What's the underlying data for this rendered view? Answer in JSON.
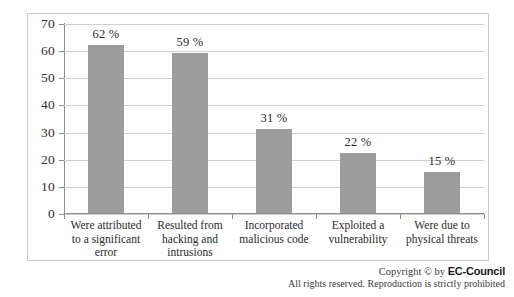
{
  "chart_data": {
    "type": "bar",
    "title": "",
    "subtitle": "",
    "xlabel": "",
    "ylabel": "",
    "ylim": [
      0,
      70
    ],
    "grid": true,
    "legend": "none",
    "orientation": "vertical",
    "bar_color": "#9c9c9c",
    "categories": [
      "Were attributed to a significant error",
      "Resulted from hacking and intrusions",
      "Incorporated malicious code",
      "Exploited a vulnerability",
      "Were due to physical threats"
    ],
    "category_lines": [
      [
        "Were attributed",
        "to a significant",
        "error"
      ],
      [
        "Resulted from",
        "hacking and",
        "intrusions"
      ],
      [
        "Incorporated",
        "malicious code"
      ],
      [
        "Exploited a",
        "vulnerability"
      ],
      [
        "Were due to",
        "physical threats"
      ]
    ],
    "values": [
      62,
      59,
      31,
      22,
      15
    ],
    "data_labels": [
      "62 %",
      "59 %",
      "31 %",
      "22 %",
      "15 %"
    ],
    "y_ticks": [
      0,
      10,
      20,
      30,
      40,
      50,
      60,
      70
    ],
    "y_tick_labels": [
      "0",
      "10",
      "20",
      "30",
      "40",
      "50",
      "60",
      "70"
    ]
  },
  "footer": {
    "copyright_prefix": "Copyright © by ",
    "brand": "EC-Council",
    "rights": "All rights reserved. Reproduction is strictly prohibited"
  }
}
